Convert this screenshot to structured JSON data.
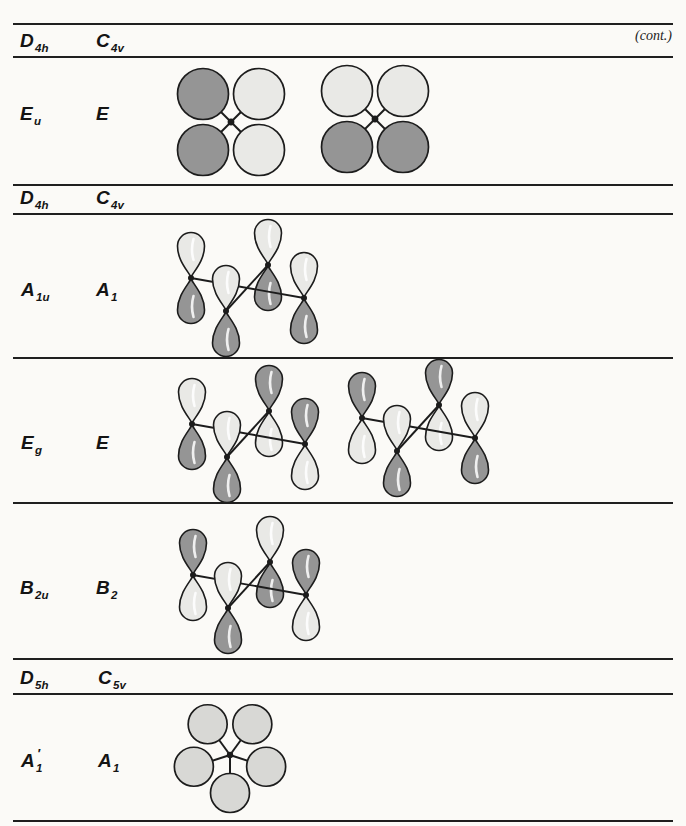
{
  "page": {
    "cont_label": "(cont.)",
    "colors": {
      "outline": "#1c1c1c",
      "dark": "#959595",
      "light": "#e9e9e6",
      "ring": "#d8d8d5",
      "paper": "#fbfaf7"
    }
  },
  "sections": [
    {
      "header": {
        "c1": "D",
        "c1s": "4h",
        "c2": "C",
        "c2s": "4v"
      },
      "rows": [
        {
          "l1": "E",
          "l1s": "u",
          "l1p": "",
          "l2": "E",
          "l2s": "",
          "l2p": "",
          "diagrams": [
            {
              "kind": "sigma4",
              "cx": 231,
              "cy": 122,
              "phases": {
                "tl": "dark",
                "tr": "light",
                "bl": "dark",
                "br": "light"
              }
            },
            {
              "kind": "sigma4",
              "cx": 375,
              "cy": 119,
              "phases": {
                "tl": "light",
                "tr": "light",
                "bl": "dark",
                "br": "dark"
              }
            }
          ]
        }
      ]
    },
    {
      "header": {
        "c1": "D",
        "c1s": "4h",
        "c2": "C",
        "c2s": "4v"
      },
      "rows": [
        {
          "l1": "A",
          "l1s": "1u",
          "l1p": "",
          "l2": "A",
          "l2s": "1",
          "l2p": "",
          "diagrams": [
            {
              "kind": "pz4",
              "x": 191,
              "y": 265,
              "up": {
                "left": "light",
                "front": "light",
                "back": "light",
                "right": "light"
              }
            }
          ]
        },
        {
          "l1": "E",
          "l1s": "g",
          "l1p": "",
          "l2": "E",
          "l2s": "",
          "l2p": "",
          "diagrams": [
            {
              "kind": "pz4",
              "x": 192,
              "y": 411,
              "up": {
                "left": "light",
                "front": "light",
                "back": "dark",
                "right": "dark"
              }
            },
            {
              "kind": "pz4",
              "x": 362,
              "y": 405,
              "up": {
                "left": "dark",
                "front": "light",
                "back": "dark",
                "right": "light"
              }
            }
          ]
        },
        {
          "l1": "B",
          "l1s": "2u",
          "l1p": "",
          "l2": "B",
          "l2s": "2",
          "l2p": "",
          "diagrams": [
            {
              "kind": "pz4",
              "x": 193,
              "y": 562,
              "up": {
                "left": "dark",
                "front": "light",
                "back": "light",
                "right": "dark"
              }
            }
          ]
        }
      ]
    },
    {
      "header": {
        "c1": "D",
        "c1s": "5h",
        "c2": "C",
        "c2s": "5v"
      },
      "rows": [
        {
          "l1": "A",
          "l1s": "1",
          "l1p": "′",
          "l2": "A",
          "l2s": "1",
          "l2p": "",
          "diagrams": [
            {
              "kind": "ring5",
              "cx": 230,
              "cy": 755
            }
          ]
        }
      ]
    }
  ]
}
